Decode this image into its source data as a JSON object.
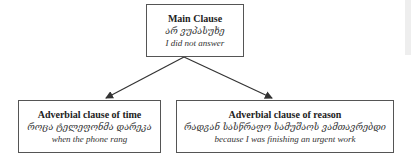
{
  "diagram": {
    "main_clause": {
      "title": "Main Clause",
      "georgian": "არ ვუპასუხე",
      "english": "I did not answer"
    },
    "time_clause": {
      "title": "Adverbial clause of time",
      "georgian": "როცა ტელეფონმა დარეკა",
      "english": "when the phone rang"
    },
    "reason_clause": {
      "title": "Adverbial clause of reason",
      "georgian": "რადგან სასწრაფო სამუშაოს ვამთავრებდი",
      "english": "because I was finishing an urgent work"
    },
    "edges": [
      {
        "from": "main_clause",
        "to": "time_clause"
      },
      {
        "from": "main_clause",
        "to": "reason_clause"
      }
    ],
    "colors": {
      "border": "#555555",
      "arrow": "#333333",
      "text": "#222222"
    }
  }
}
